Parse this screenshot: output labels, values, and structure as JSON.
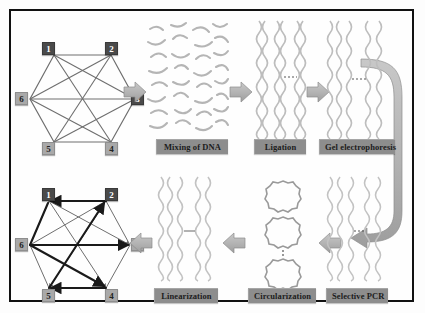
{
  "figure": {
    "border_color": "#111111",
    "background": "#fefefe"
  },
  "colors": {
    "label_bar": "#8d8d8d",
    "label_text": "#1c1c1c",
    "node_dark": "#4a4a4a",
    "node_light": "#a9a9a9",
    "block_arrow": "#b0b0b0",
    "block_arrow_edge": "#8e8e8e",
    "dna_strand": "#b9b9b9",
    "graph_edge_thin": "#6e6e6e",
    "graph_edge_bold": "#1a1a1a"
  },
  "graphs": {
    "input_graph": {
      "name": "undirected-input-graph",
      "nodes": [
        {
          "id": "1",
          "label": "1",
          "style": "dark",
          "x": 37,
          "y": 38
        },
        {
          "id": "2",
          "label": "2",
          "style": "dark",
          "x": 94,
          "y": 38
        },
        {
          "id": "3",
          "label": "3",
          "style": "dark",
          "x": 118,
          "y": 82
        },
        {
          "id": "4",
          "label": "4",
          "style": "light",
          "x": 94,
          "y": 125
        },
        {
          "id": "5",
          "label": "5",
          "style": "light",
          "x": 37,
          "y": 125
        },
        {
          "id": "6",
          "label": "6",
          "style": "light",
          "x": 13,
          "y": 82
        }
      ],
      "edges": [
        [
          "1",
          "2"
        ],
        [
          "2",
          "3"
        ],
        [
          "3",
          "4"
        ],
        [
          "4",
          "5"
        ],
        [
          "5",
          "6"
        ],
        [
          "6",
          "1"
        ],
        [
          "6",
          "3"
        ],
        [
          "1",
          "4"
        ],
        [
          "2",
          "5"
        ],
        [
          "1",
          "3"
        ],
        [
          "2",
          "6"
        ],
        [
          "5",
          "3"
        ],
        [
          "6",
          "4"
        ]
      ],
      "directed": false
    },
    "output_graph": {
      "name": "directed-solution-graph",
      "nodes": [
        {
          "id": "1",
          "label": "1",
          "style": "dark",
          "x": 37,
          "y": 192
        },
        {
          "id": "2",
          "label": "2",
          "style": "dark",
          "x": 94,
          "y": 192
        },
        {
          "id": "3",
          "label": "3",
          "style": "light",
          "x": 118,
          "y": 236
        },
        {
          "id": "4",
          "label": "4",
          "style": "light",
          "x": 94,
          "y": 279
        },
        {
          "id": "5",
          "label": "5",
          "style": "light",
          "x": 37,
          "y": 279
        },
        {
          "id": "6",
          "label": "6",
          "style": "light",
          "x": 13,
          "y": 236
        }
      ],
      "edges": [
        [
          "1",
          "2"
        ],
        [
          "2",
          "3"
        ],
        [
          "3",
          "4"
        ],
        [
          "4",
          "5"
        ],
        [
          "5",
          "6"
        ],
        [
          "6",
          "1"
        ],
        [
          "6",
          "3"
        ],
        [
          "1",
          "4"
        ],
        [
          "2",
          "5"
        ],
        [
          "1",
          "3"
        ],
        [
          "2",
          "6"
        ],
        [
          "5",
          "3"
        ],
        [
          "6",
          "4"
        ]
      ],
      "path": [
        "6",
        "3"
      ],
      "directed": true
    }
  },
  "steps": [
    {
      "id": "mixing",
      "label": "Mixing of DNA",
      "row": "top",
      "order": 1,
      "content": "random-ssdna-fragments"
    },
    {
      "id": "ligation",
      "label": "Ligation",
      "row": "top",
      "order": 2,
      "content": "vertical-duplex-strands"
    },
    {
      "id": "gel",
      "label": "Gel electrophoresis",
      "row": "top",
      "order": 3,
      "content": "gel-lane-strands"
    },
    {
      "id": "pcr",
      "label": "Selective PCR",
      "row": "bottom",
      "order": 4,
      "content": "gel-lane-strands"
    },
    {
      "id": "circular",
      "label": "Circularization",
      "row": "bottom",
      "order": 5,
      "content": "dna-circles"
    },
    {
      "id": "linear",
      "label": "Linearization",
      "row": "bottom",
      "order": 6,
      "content": "vertical-duplex-strands"
    }
  ],
  "arrows": [
    {
      "id": "a1",
      "name": "arrow-graph-to-mixing",
      "direction": "right"
    },
    {
      "id": "a2",
      "name": "arrow-mixing-to-ligation",
      "direction": "right"
    },
    {
      "id": "a3",
      "name": "arrow-ligation-to-gel",
      "direction": "right"
    },
    {
      "id": "a4",
      "name": "arrow-gel-to-pcr",
      "direction": "wrap-down-left"
    },
    {
      "id": "a5",
      "name": "arrow-pcr-to-circular",
      "direction": "left"
    },
    {
      "id": "a6",
      "name": "arrow-circular-to-linear",
      "direction": "left"
    },
    {
      "id": "a7",
      "name": "arrow-linear-to-graph",
      "direction": "left"
    }
  ]
}
